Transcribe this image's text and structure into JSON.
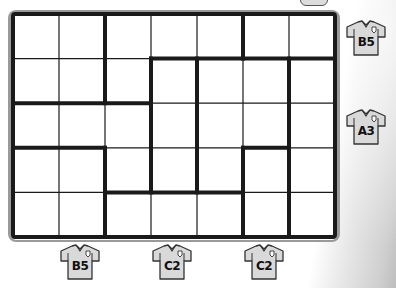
{
  "puzzle": {
    "rows": 5,
    "cols": 7,
    "thick_vertical_segments": [
      {
        "col_line": 2,
        "from_row": 0,
        "to_row": 2
      },
      {
        "col_line": 3,
        "from_row": 1,
        "to_row": 4
      },
      {
        "col_line": 4,
        "from_row": 1,
        "to_row": 4
      },
      {
        "col_line": 5,
        "from_row": 0,
        "to_row": 1
      },
      {
        "col_line": 5,
        "from_row": 3,
        "to_row": 5
      },
      {
        "col_line": 6,
        "from_row": 1,
        "to_row": 5
      },
      {
        "col_line": 2,
        "from_row": 3,
        "to_row": 5
      }
    ],
    "thick_horizontal_segments": [
      {
        "row_line": 1,
        "from_col": 3,
        "to_col": 7
      },
      {
        "row_line": 2,
        "from_col": 0,
        "to_col": 3
      },
      {
        "row_line": 3,
        "from_col": 0,
        "to_col": 2
      },
      {
        "row_line": 3,
        "from_col": 5,
        "to_col": 6
      },
      {
        "row_line": 4,
        "from_col": 2,
        "to_col": 5
      }
    ]
  },
  "side_clues": [
    {
      "row": 0,
      "label": "B5"
    },
    {
      "row": 2,
      "label": "A3"
    }
  ],
  "bottom_clues": [
    {
      "col": 1,
      "label": "B5"
    },
    {
      "col": 3,
      "label": "C2"
    },
    {
      "col": 5,
      "label": "C2"
    }
  ],
  "colors": {
    "jersey_fill": "#d9d9d9",
    "line": "#1a1a1a",
    "frame": "#9a9a9a"
  }
}
